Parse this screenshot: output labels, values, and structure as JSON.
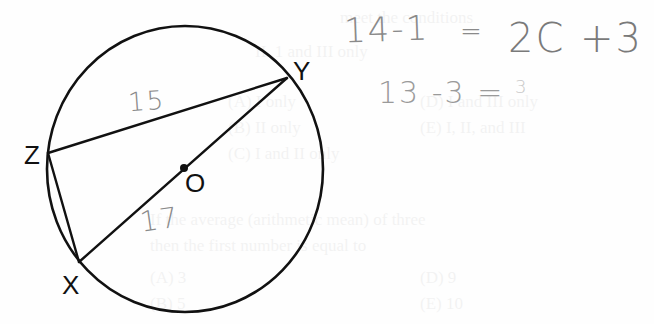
{
  "figure": {
    "stroke_color": "#111111",
    "handwriting_color": "#8a8a8a",
    "points": {
      "Y": {
        "label": "Y"
      },
      "Z": {
        "label": "Z"
      },
      "X": {
        "label": "X"
      },
      "O": {
        "label": "O"
      }
    },
    "segment_annotations": {
      "ZY": "15",
      "OX": "17"
    }
  },
  "handwriting": {
    "line1": {
      "left": "14-1",
      "equals": "=",
      "right": "2C +3"
    },
    "line2": "13 -3 =",
    "line2_scribble": "3"
  },
  "background_bleed": {
    "lines": [
      "meet the conditions",
      "II. 1 and III only",
      "(A) I only",
      "(B) II only",
      "(C) I and II only",
      "(D) I and III only",
      "(E) I, II, and III",
      "If the average (arithmetic mean) of three",
      "then the first number is equal to",
      "(A) 3",
      "(B) 5",
      "(D) 9",
      "(E) 10"
    ]
  }
}
